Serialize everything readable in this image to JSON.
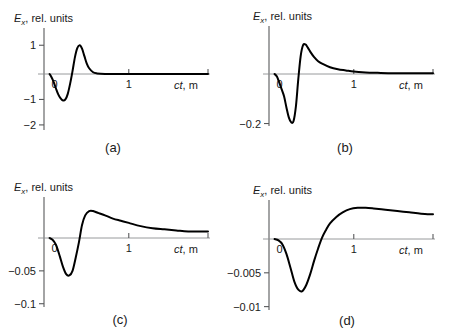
{
  "figure": {
    "panel_count": 4,
    "background_color": "#ffffff",
    "curve_color": "#000000",
    "axis_color": "#58595b"
  },
  "chart_data": [
    {
      "type": "line",
      "panel": "a",
      "label": "(a)",
      "title": "",
      "ylabel": "E_x, rel. units",
      "ylabel_base": "E",
      "ylabel_sub": "x",
      "ylabel_rest": ", rel. units",
      "xlabel": "ct, m",
      "xlabel_ital": "ct",
      "xlabel_rest": ", m",
      "xlim": [
        -0.07,
        2.0
      ],
      "ylim": [
        -2.2,
        1.6
      ],
      "yticks": [
        1,
        -1,
        -2
      ],
      "ytick_labels": [
        "1",
        "-1",
        "-2"
      ],
      "xticks": [
        0,
        1,
        2
      ],
      "xtick_labels": [
        "0",
        "1",
        ""
      ],
      "grid": false,
      "legend": "none",
      "x": [
        0.0,
        0.02,
        0.05,
        0.08,
        0.11,
        0.14,
        0.17,
        0.2,
        0.23,
        0.26,
        0.29,
        0.32,
        0.35,
        0.38,
        0.41,
        0.44,
        0.47,
        0.5,
        0.55,
        0.6,
        0.7,
        0.85,
        1.0,
        1.2,
        1.5,
        1.8,
        2.0
      ],
      "y": [
        0.0,
        -0.1,
        -0.3,
        -0.56,
        -0.8,
        -0.96,
        -1.04,
        -1.0,
        -0.78,
        -0.38,
        0.1,
        0.58,
        0.9,
        1.0,
        0.88,
        0.62,
        0.36,
        0.2,
        0.06,
        0.02,
        0.0,
        0.0,
        0.0,
        0.0,
        0.0,
        0.0,
        0.0
      ]
    },
    {
      "type": "line",
      "panel": "b",
      "label": "(b)",
      "title": "",
      "ylabel": "E_x, rel. units",
      "ylabel_base": "E",
      "ylabel_sub": "x",
      "ylabel_rest": ", rel. units",
      "xlabel": "ct, m",
      "xlabel_ital": "ct",
      "xlabel_rest": ", m",
      "xlim": [
        -0.07,
        2.0
      ],
      "ylim": [
        -0.21,
        0.12
      ],
      "yticks": [
        -0.2
      ],
      "ytick_labels": [
        "-0.2"
      ],
      "xticks": [
        0,
        1,
        2
      ],
      "xtick_labels": [
        "0",
        "1",
        ""
      ],
      "grid": false,
      "legend": "none",
      "x": [
        0.0,
        0.03,
        0.06,
        0.09,
        0.12,
        0.15,
        0.18,
        0.21,
        0.24,
        0.27,
        0.3,
        0.33,
        0.36,
        0.39,
        0.42,
        0.45,
        0.5,
        0.55,
        0.6,
        0.7,
        0.8,
        0.9,
        1.0,
        1.15,
        1.3,
        1.5,
        1.7,
        2.0
      ],
      "y": [
        0.0,
        -0.01,
        -0.035,
        -0.062,
        -0.09,
        -0.135,
        -0.175,
        -0.195,
        -0.19,
        -0.13,
        -0.02,
        0.045,
        0.072,
        0.074,
        0.066,
        0.056,
        0.042,
        0.032,
        0.026,
        0.017,
        0.012,
        0.009,
        0.006,
        0.004,
        0.003,
        0.002,
        0.002,
        0.002
      ]
    },
    {
      "type": "line",
      "panel": "c",
      "label": "(c)",
      "title": "",
      "ylabel": "E_x, rel. units",
      "ylabel_base": "E",
      "ylabel_sub": "x",
      "ylabel_rest": ", rel. units",
      "xlabel": "ct, m",
      "xlabel_ital": "ct",
      "xlabel_rest": ", m",
      "xlim": [
        -0.07,
        2.0
      ],
      "ylim": [
        -0.105,
        0.038
      ],
      "yticks": [
        -0.05,
        -0.1
      ],
      "ytick_labels": [
        "-0.05",
        "-0.1"
      ],
      "xticks": [
        0,
        1,
        2
      ],
      "xtick_labels": [
        "0",
        "1",
        ""
      ],
      "grid": false,
      "legend": "none",
      "x": [
        0.0,
        0.03,
        0.06,
        0.09,
        0.13,
        0.17,
        0.21,
        0.25,
        0.29,
        0.33,
        0.37,
        0.41,
        0.45,
        0.5,
        0.55,
        0.62,
        0.7,
        0.8,
        0.9,
        1.0,
        1.15,
        1.3,
        1.45,
        1.6,
        1.75,
        2.0
      ],
      "y": [
        0.0,
        -0.002,
        -0.006,
        -0.013,
        -0.028,
        -0.044,
        -0.055,
        -0.057,
        -0.05,
        -0.03,
        -0.007,
        0.012,
        0.021,
        0.025,
        0.025,
        0.023,
        0.021,
        0.018,
        0.016,
        0.014,
        0.011,
        0.009,
        0.008,
        0.007,
        0.006,
        0.006
      ]
    },
    {
      "type": "line",
      "panel": "d",
      "label": "(d)",
      "title": "",
      "ylabel": "E_x, rel. units",
      "ylabel_base": "E",
      "ylabel_sub": "x",
      "ylabel_rest": ", rel. units",
      "xlabel": "ct, m",
      "xlabel_ital": "ct",
      "xlabel_rest": ", m",
      "xlim": [
        -0.07,
        2.0
      ],
      "ylim": [
        -0.0105,
        0.006
      ],
      "yticks": [
        -0.005,
        -0.01
      ],
      "ytick_labels": [
        "-0.005",
        "-0.01"
      ],
      "xticks": [
        0,
        1,
        2
      ],
      "xtick_labels": [
        "0",
        "1",
        ""
      ],
      "grid": false,
      "legend": "none",
      "x": [
        0.0,
        0.05,
        0.1,
        0.15,
        0.2,
        0.25,
        0.3,
        0.35,
        0.4,
        0.45,
        0.5,
        0.55,
        0.6,
        0.65,
        0.7,
        0.78,
        0.86,
        0.95,
        1.05,
        1.15,
        1.25,
        1.4,
        1.55,
        1.7,
        1.85,
        2.0
      ],
      "y": [
        0.0,
        -0.0002,
        -0.0008,
        -0.0022,
        -0.0042,
        -0.0063,
        -0.0075,
        -0.0077,
        -0.0068,
        -0.0052,
        -0.0032,
        -0.0014,
        0.0002,
        0.0014,
        0.0024,
        0.0034,
        0.0041,
        0.0046,
        0.0048,
        0.0048,
        0.0047,
        0.0045,
        0.0043,
        0.0041,
        0.0039,
        0.0038
      ]
    }
  ]
}
